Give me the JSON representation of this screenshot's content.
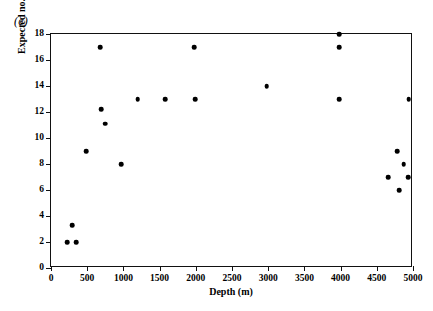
{
  "figure": {
    "panel_label": "(c)"
  },
  "chart_data": {
    "type": "scatter",
    "title": "",
    "xlabel": "Depth (m)",
    "ylabel": "Expected no. of species",
    "xlim": [
      0,
      5000
    ],
    "ylim": [
      0,
      18
    ],
    "xticks": [
      0,
      500,
      1000,
      1500,
      2000,
      2500,
      3000,
      3500,
      4000,
      4500,
      5000
    ],
    "xtick_labels": [
      "0",
      "500",
      "1000",
      "1500",
      "2000",
      "2500",
      "3000",
      "3500",
      "4000",
      "4500",
      "5000"
    ],
    "yticks": [
      0,
      2,
      4,
      6,
      8,
      10,
      12,
      14,
      16,
      18
    ],
    "ytick_labels": [
      "0",
      "2",
      "4",
      "6",
      "8",
      "10",
      "12",
      "14",
      "16",
      "18"
    ],
    "grid": false,
    "legend": "none",
    "marker": "filled-circle",
    "marker_color": "#000000",
    "points": [
      {
        "x": 220,
        "y": 2
      },
      {
        "x": 290,
        "y": 3.3
      },
      {
        "x": 345,
        "y": 2
      },
      {
        "x": 490,
        "y": 9
      },
      {
        "x": 680,
        "y": 17
      },
      {
        "x": 690,
        "y": 12.2
      },
      {
        "x": 745,
        "y": 11.1
      },
      {
        "x": 970,
        "y": 8
      },
      {
        "x": 1200,
        "y": 13
      },
      {
        "x": 1580,
        "y": 13
      },
      {
        "x": 1980,
        "y": 17
      },
      {
        "x": 1990,
        "y": 13
      },
      {
        "x": 2980,
        "y": 14
      },
      {
        "x": 3980,
        "y": 18
      },
      {
        "x": 3980,
        "y": 17
      },
      {
        "x": 3980,
        "y": 13
      },
      {
        "x": 4660,
        "y": 7
      },
      {
        "x": 4780,
        "y": 9
      },
      {
        "x": 4870,
        "y": 8
      },
      {
        "x": 4810,
        "y": 6
      },
      {
        "x": 4930,
        "y": 7
      },
      {
        "x": 4940,
        "y": 13
      }
    ]
  }
}
